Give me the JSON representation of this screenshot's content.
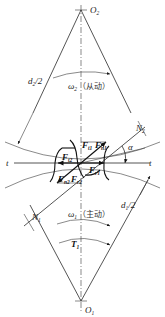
{
  "diagram": {
    "centers": {
      "driven": {
        "label": "O",
        "sub": "2"
      },
      "driver": {
        "label": "O",
        "sub": "1"
      }
    },
    "radii": {
      "driven": {
        "label": "d",
        "sub": "2",
        "suffix": "/2"
      },
      "driver": {
        "label": "d",
        "sub": "1",
        "suffix": "/2"
      }
    },
    "speeds": {
      "driven": {
        "symbol": "ω",
        "sub": "2",
        "note": "（从动）"
      },
      "driver": {
        "symbol": "ω",
        "sub": "1",
        "note": "（主动）"
      }
    },
    "torque": {
      "symbol": "T",
      "sub": "1"
    },
    "tangent_line": {
      "left": "t",
      "right": "t"
    },
    "line_of_action": {
      "n2": {
        "label": "N",
        "sub": "2"
      },
      "n1": {
        "label": "N",
        "sub": "1"
      }
    },
    "pressure_angle": "α",
    "forces": {
      "Ft1": {
        "label": "F",
        "sub": "t1"
      },
      "Fn1": {
        "label": "F",
        "sub": "n1"
      },
      "Fr1": {
        "label": "F",
        "sub": "r1"
      },
      "Ft2": {
        "label": "F",
        "sub": "t2"
      },
      "Fn2": {
        "label": "F",
        "sub": "n2"
      },
      "Fr2": {
        "label": "F",
        "sub": "r2"
      }
    }
  }
}
